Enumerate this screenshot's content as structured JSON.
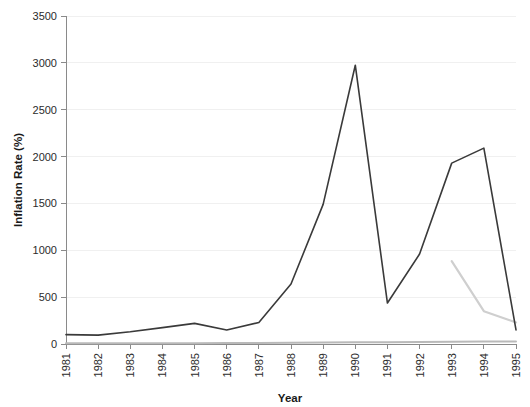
{
  "chart_data": {
    "type": "line",
    "title": "",
    "xlabel": "Year",
    "ylabel": "Inflation Rate (%)",
    "x": [
      1981,
      1982,
      1983,
      1984,
      1985,
      1986,
      1987,
      1988,
      1989,
      1990,
      1991,
      1992,
      1993,
      1994,
      1995
    ],
    "xtick_labels": [
      "1981",
      "1982",
      "1983",
      "1984",
      "1985",
      "1986",
      "1987",
      "1988",
      "1989",
      "1990",
      "1991",
      "1992",
      "1993",
      "1994",
      "1995"
    ],
    "ytick_labels": [
      "0",
      "500",
      "1000",
      "1500",
      "2000",
      "2500",
      "3000",
      "3500"
    ],
    "yticks": [
      0,
      500,
      1000,
      1500,
      2000,
      2500,
      3000,
      3500
    ],
    "ylim": [
      0,
      3500
    ],
    "xlim": [
      1981,
      1995
    ],
    "grid": true,
    "legend": "none",
    "series": [
      {
        "name": "primary-dark-series",
        "color": "#3a3a3a",
        "width": 1.6,
        "x": [
          1981,
          1982,
          1983,
          1984,
          1985,
          1986,
          1987,
          1988,
          1989,
          1990,
          1991,
          1992,
          1993,
          1994,
          1995
        ],
        "values": [
          100,
          95,
          130,
          175,
          220,
          150,
          230,
          640,
          1490,
          2975,
          437,
          960,
          1930,
          2090,
          150
        ]
      },
      {
        "name": "light-gray-series",
        "color": "#cfcfcf",
        "width": 2.2,
        "x": [
          1993,
          1994,
          1995
        ],
        "values": [
          885,
          350,
          230
        ]
      },
      {
        "name": "baseline-gray-series",
        "color": "#b9b9b9",
        "width": 2.0,
        "x": [
          1981,
          1982,
          1983,
          1984,
          1985,
          1986,
          1987,
          1988,
          1989,
          1990,
          1991,
          1992,
          1993,
          1994,
          1995
        ],
        "values": [
          8,
          8,
          8,
          8,
          8,
          10,
          12,
          14,
          16,
          18,
          20,
          22,
          24,
          26,
          26
        ]
      }
    ]
  },
  "colors": {
    "background": "#ffffff",
    "axis": "#8a8a8a",
    "grid": "#f0f0f0",
    "text": "#2b2b2b",
    "primary_series": "#3a3a3a",
    "secondary_series": "#cfcfcf",
    "baseline_series": "#b9b9b9"
  }
}
